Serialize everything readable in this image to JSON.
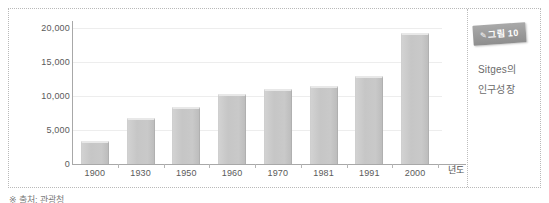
{
  "figure": {
    "badge_mark": "✎",
    "badge_label": "그림 10",
    "caption_line_1": "Sitges의",
    "caption_line_2": "인구성장",
    "source_note": "※ 출처: 관광청"
  },
  "chart_data": {
    "type": "bar",
    "title": "",
    "xlabel": "년도",
    "ylabel": "",
    "categories": [
      "1900",
      "1930",
      "1950",
      "1960",
      "1970",
      "1981",
      "1991",
      "2000"
    ],
    "values": [
      3400,
      6800,
      8400,
      10300,
      11100,
      11500,
      12900,
      19200
    ],
    "ylim": [
      0,
      20000
    ],
    "ytick_labels": [
      "0",
      "5,000",
      "10,000",
      "15,000",
      "20,000"
    ],
    "ytick_values": [
      0,
      5000,
      10000,
      15000,
      20000
    ],
    "grid": true,
    "legend": false,
    "bar_color": "#c8c8c8",
    "axis_color": "#a8a8a8",
    "grid_color": "#ededed",
    "text_color": "#5a5a5a"
  }
}
